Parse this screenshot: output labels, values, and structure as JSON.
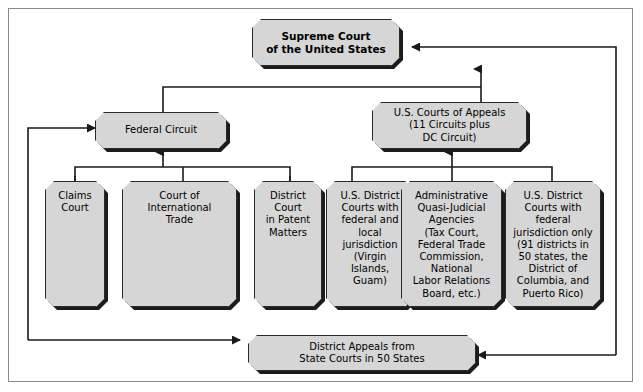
{
  "diagram": {
    "colors": {
      "node_fill": "#d6d6d6",
      "node_border": "#2a2a2a",
      "shadow": "#1c1c1c",
      "frame_border": "#8a8a8a",
      "connector": "#1a1a1a",
      "background": "#ffffff"
    },
    "nodes": {
      "supreme_court": {
        "label": "Supreme Court\nof the United States"
      },
      "federal_circuit": {
        "label": "Federal Circuit"
      },
      "courts_of_appeals": {
        "label": "U.S. Courts of Appeals\n(11 Circuits plus\nDC Circuit)"
      },
      "claims_court": {
        "label": "Claims\nCourt"
      },
      "court_international_trade": {
        "label": "Court of\nInternational\nTrade"
      },
      "district_court_patent": {
        "label": "District\nCourt\nin Patent\nMatters"
      },
      "district_courts_federal_local": {
        "label": "U.S. District\nCourts with\nfederal and\nlocal\njurisdiction\n(Virgin\nIslands,\nGuam)"
      },
      "administrative_agencies": {
        "label": "Administrative\nQuasi-Judicial\nAgencies\n(Tax Court,\nFederal Trade\nCommission,\nNational\nLabor Relations\nBoard, etc.)"
      },
      "district_courts_federal_only": {
        "label": "U.S. District\nCourts with\nfederal\njurisdiction only\n(91 districts in\n50 states, the\nDistrict of\nColumbia, and\nPuerto Rico)"
      },
      "district_appeals_state": {
        "label": "District Appeals from\nState Courts in 50 States"
      }
    }
  }
}
